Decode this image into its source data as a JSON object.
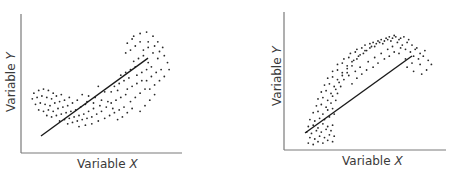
{
  "chart_data": [
    {
      "type": "scatter",
      "title": "",
      "xlabel": "Variable X",
      "ylabel": "Variable Y",
      "xlabel_parts": {
        "prefix": "Variable ",
        "letter": "X"
      },
      "ylabel_parts": {
        "prefix": "Variable ",
        "letter": "Y"
      },
      "grid": false,
      "legend": null,
      "ticks": false,
      "description": "Convex (upward-curving) scatter cloud with a straight linear fit line",
      "axis_range": {
        "x": [
          0,
          100
        ],
        "y": [
          0,
          100
        ]
      },
      "fit_line": {
        "x": [
          12.4,
          78.9
        ],
        "y": [
          12.2,
          68.3
        ]
      },
      "points": [
        [
          8,
          43
        ],
        [
          11,
          45
        ],
        [
          14,
          46
        ],
        [
          17,
          45
        ],
        [
          20,
          43
        ],
        [
          7,
          39
        ],
        [
          10,
          40
        ],
        [
          13,
          41
        ],
        [
          16,
          40
        ],
        [
          19,
          39
        ],
        [
          22,
          41
        ],
        [
          25,
          42
        ],
        [
          9,
          35
        ],
        [
          12,
          36
        ],
        [
          15,
          35
        ],
        [
          18,
          34
        ],
        [
          21,
          36
        ],
        [
          24,
          37
        ],
        [
          27,
          38
        ],
        [
          30,
          40
        ],
        [
          11,
          31
        ],
        [
          14,
          30
        ],
        [
          17,
          31
        ],
        [
          20,
          30
        ],
        [
          23,
          32
        ],
        [
          26,
          33
        ],
        [
          29,
          34
        ],
        [
          32,
          36
        ],
        [
          35,
          38
        ],
        [
          16,
          27
        ],
        [
          19,
          26
        ],
        [
          22,
          27
        ],
        [
          25,
          28
        ],
        [
          28,
          29
        ],
        [
          31,
          30
        ],
        [
          34,
          31
        ],
        [
          37,
          33
        ],
        [
          40,
          35
        ],
        [
          24,
          23
        ],
        [
          27,
          24
        ],
        [
          30,
          25
        ],
        [
          33,
          26
        ],
        [
          36,
          27
        ],
        [
          39,
          28
        ],
        [
          42,
          30
        ],
        [
          45,
          32
        ],
        [
          29,
          21
        ],
        [
          32,
          22
        ],
        [
          35,
          23
        ],
        [
          38,
          24
        ],
        [
          41,
          25
        ],
        [
          44,
          26
        ],
        [
          47,
          28
        ],
        [
          50,
          30
        ],
        [
          36,
          19
        ],
        [
          40,
          20
        ],
        [
          44,
          21
        ],
        [
          48,
          23
        ],
        [
          52,
          25
        ],
        [
          38,
          42
        ],
        [
          42,
          41
        ],
        [
          46,
          40
        ],
        [
          50,
          38
        ],
        [
          54,
          37
        ],
        [
          41,
          37
        ],
        [
          45,
          36
        ],
        [
          49,
          34
        ],
        [
          53,
          33
        ],
        [
          57,
          32
        ],
        [
          52,
          44
        ],
        [
          56,
          44
        ],
        [
          60,
          45
        ],
        [
          48,
          48
        ],
        [
          55,
          27
        ],
        [
          58,
          29
        ],
        [
          61,
          31
        ],
        [
          64,
          33
        ],
        [
          56,
          36
        ],
        [
          59,
          38
        ],
        [
          62,
          40
        ],
        [
          65,
          42
        ],
        [
          58,
          48
        ],
        [
          61,
          50
        ],
        [
          64,
          52
        ],
        [
          67,
          54
        ],
        [
          60,
          24
        ],
        [
          63,
          26
        ],
        [
          66,
          29
        ],
        [
          69,
          32
        ],
        [
          62,
          56
        ],
        [
          65,
          58
        ],
        [
          68,
          60
        ],
        [
          71,
          62
        ],
        [
          66,
          46
        ],
        [
          69,
          48
        ],
        [
          72,
          50
        ],
        [
          75,
          52
        ],
        [
          68,
          37
        ],
        [
          71,
          40
        ],
        [
          74,
          43
        ],
        [
          77,
          46
        ],
        [
          70,
          66
        ],
        [
          73,
          68
        ],
        [
          76,
          70
        ],
        [
          79,
          65
        ],
        [
          72,
          56
        ],
        [
          75,
          58
        ],
        [
          78,
          60
        ],
        [
          81,
          62
        ],
        [
          74,
          30
        ],
        [
          77,
          34
        ],
        [
          80,
          38
        ],
        [
          83,
          42
        ],
        [
          76,
          74
        ],
        [
          79,
          76
        ],
        [
          82,
          72
        ],
        [
          85,
          68
        ],
        [
          78,
          52
        ],
        [
          81,
          55
        ],
        [
          84,
          58
        ],
        [
          87,
          60
        ],
        [
          80,
          46
        ],
        [
          83,
          49
        ],
        [
          86,
          52
        ],
        [
          89,
          55
        ],
        [
          65,
          72
        ],
        [
          68,
          74
        ],
        [
          71,
          77
        ],
        [
          74,
          80
        ],
        [
          70,
          84
        ],
        [
          74,
          86
        ],
        [
          78,
          87
        ],
        [
          82,
          84
        ],
        [
          85,
          80
        ],
        [
          88,
          76
        ],
        [
          66,
          79
        ],
        [
          69,
          82
        ],
        [
          79,
          80
        ],
        [
          83,
          77
        ],
        [
          86,
          73
        ],
        [
          89,
          70
        ],
        [
          91,
          65
        ],
        [
          92,
          60
        ]
      ]
    },
    {
      "type": "scatter",
      "title": "",
      "xlabel": "Variable X",
      "ylabel": "Variable Y",
      "xlabel_parts": {
        "prefix": "Variable ",
        "letter": "X"
      },
      "ylabel_parts": {
        "prefix": "Variable ",
        "letter": "Y"
      },
      "grid": false,
      "legend": null,
      "ticks": false,
      "description": "Concave (downward-curving) scatter cloud with a straight linear fit line",
      "axis_range": {
        "x": [
          0,
          100
        ],
        "y": [
          0,
          100
        ]
      },
      "fit_line": {
        "x": [
          13.0,
          79.0
        ],
        "y": [
          12.3,
          68.1
        ]
      },
      "points": [
        [
          15,
          5
        ],
        [
          18,
          4
        ],
        [
          21,
          6
        ],
        [
          24,
          5
        ],
        [
          27,
          7
        ],
        [
          30,
          6
        ],
        [
          16,
          9
        ],
        [
          19,
          8
        ],
        [
          22,
          10
        ],
        [
          25,
          9
        ],
        [
          28,
          11
        ],
        [
          31,
          10
        ],
        [
          14,
          13
        ],
        [
          17,
          12
        ],
        [
          20,
          14
        ],
        [
          23,
          13
        ],
        [
          26,
          15
        ],
        [
          29,
          14
        ],
        [
          15,
          17
        ],
        [
          18,
          18
        ],
        [
          21,
          16
        ],
        [
          24,
          19
        ],
        [
          27,
          17
        ],
        [
          30,
          18
        ],
        [
          16,
          22
        ],
        [
          19,
          21
        ],
        [
          22,
          23
        ],
        [
          25,
          22
        ],
        [
          28,
          24
        ],
        [
          31,
          26
        ],
        [
          18,
          27
        ],
        [
          21,
          28
        ],
        [
          24,
          26
        ],
        [
          27,
          29
        ],
        [
          30,
          30
        ],
        [
          20,
          32
        ],
        [
          23,
          33
        ],
        [
          26,
          31
        ],
        [
          29,
          34
        ],
        [
          32,
          36
        ],
        [
          21,
          37
        ],
        [
          24,
          38
        ],
        [
          27,
          36
        ],
        [
          30,
          39
        ],
        [
          33,
          41
        ],
        [
          23,
          42
        ],
        [
          26,
          43
        ],
        [
          29,
          41
        ],
        [
          32,
          44
        ],
        [
          35,
          46
        ],
        [
          25,
          47
        ],
        [
          28,
          48
        ],
        [
          31,
          46
        ],
        [
          34,
          49
        ],
        [
          37,
          51
        ],
        [
          27,
          52
        ],
        [
          30,
          53
        ],
        [
          33,
          51
        ],
        [
          36,
          54
        ],
        [
          39,
          56
        ],
        [
          30,
          57
        ],
        [
          33,
          58
        ],
        [
          36,
          56
        ],
        [
          39,
          59
        ],
        [
          42,
          61
        ],
        [
          33,
          62
        ],
        [
          36,
          63
        ],
        [
          39,
          61
        ],
        [
          42,
          64
        ],
        [
          45,
          66
        ],
        [
          37,
          66
        ],
        [
          40,
          67
        ],
        [
          43,
          65
        ],
        [
          46,
          68
        ],
        [
          49,
          70
        ],
        [
          41,
          70
        ],
        [
          44,
          71
        ],
        [
          47,
          69
        ],
        [
          50,
          72
        ],
        [
          53,
          74
        ],
        [
          45,
          73
        ],
        [
          48,
          74
        ],
        [
          51,
          72
        ],
        [
          54,
          75
        ],
        [
          57,
          77
        ],
        [
          50,
          76
        ],
        [
          53,
          77
        ],
        [
          56,
          75
        ],
        [
          59,
          78
        ],
        [
          62,
          79
        ],
        [
          55,
          78
        ],
        [
          58,
          79
        ],
        [
          61,
          77
        ],
        [
          64,
          80
        ],
        [
          67,
          81
        ],
        [
          60,
          80
        ],
        [
          63,
          81
        ],
        [
          66,
          79
        ],
        [
          69,
          82
        ],
        [
          72,
          81
        ],
        [
          65,
          82
        ],
        [
          68,
          83
        ],
        [
          71,
          80
        ],
        [
          74,
          82
        ],
        [
          77,
          80
        ],
        [
          70,
          78
        ],
        [
          73,
          76
        ],
        [
          76,
          78
        ],
        [
          79,
          76
        ],
        [
          82,
          74
        ],
        [
          75,
          73
        ],
        [
          78,
          71
        ],
        [
          81,
          73
        ],
        [
          84,
          70
        ],
        [
          87,
          72
        ],
        [
          80,
          68
        ],
        [
          83,
          66
        ],
        [
          86,
          68
        ],
        [
          89,
          65
        ],
        [
          91,
          62
        ],
        [
          42,
          48
        ],
        [
          45,
          52
        ],
        [
          48,
          55
        ],
        [
          51,
          58
        ],
        [
          55,
          60
        ],
        [
          58,
          63
        ],
        [
          62,
          66
        ],
        [
          65,
          68
        ],
        [
          68,
          71
        ],
        [
          72,
          74
        ],
        [
          40,
          54
        ],
        [
          44,
          57
        ],
        [
          47,
          60
        ],
        [
          52,
          64
        ],
        [
          56,
          67
        ],
        [
          60,
          70
        ],
        [
          64,
          73
        ],
        [
          67,
          75
        ],
        [
          71,
          70
        ],
        [
          75,
          66
        ],
        [
          79,
          63
        ],
        [
          84,
          62
        ],
        [
          88,
          58
        ],
        [
          76,
          60
        ],
        [
          80,
          57
        ],
        [
          85,
          55
        ]
      ]
    }
  ],
  "panels": [
    {
      "plot": {
        "left": 21,
        "top": 14,
        "right": 182,
        "bottom": 153
      },
      "ylabel": {
        "prefix": "Variable ",
        "letter": "Y"
      },
      "xlabel": {
        "prefix": "Variable ",
        "letter": "X"
      }
    },
    {
      "plot": {
        "left": 54,
        "top": 12,
        "right": 216,
        "bottom": 150
      },
      "ylabel": {
        "prefix": "Variable ",
        "letter": "Y"
      },
      "xlabel": {
        "prefix": "Variable ",
        "letter": "X"
      }
    }
  ],
  "colors": {
    "axis": "#7a7a7a",
    "dot": "#2a2a2a",
    "fit_line": "#1a1a1a",
    "label": "#3a3a3a",
    "background": "#ffffff"
  }
}
